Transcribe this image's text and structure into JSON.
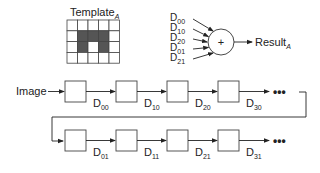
{
  "template": {
    "title": "Template",
    "subscript": "A",
    "rows": 4,
    "cols": 5,
    "filled": [
      [
        1,
        1
      ],
      [
        1,
        2
      ],
      [
        1,
        3
      ],
      [
        2,
        1
      ],
      [
        2,
        3
      ]
    ],
    "fill_color": "#555555"
  },
  "summation": {
    "inputs": [
      {
        "base": "D",
        "sub": "00"
      },
      {
        "base": "D",
        "sub": "10"
      },
      {
        "base": "D",
        "sub": "20"
      },
      {
        "base": "D",
        "sub": "01"
      },
      {
        "base": "D",
        "sub": "21"
      }
    ],
    "operator": "+",
    "output": {
      "base": "Result",
      "sub": "A"
    }
  },
  "pipeline": {
    "input_label": "Image",
    "row1": [
      {
        "base": "D",
        "sub": "00"
      },
      {
        "base": "D",
        "sub": "10"
      },
      {
        "base": "D",
        "sub": "20"
      },
      {
        "base": "D",
        "sub": "30"
      }
    ],
    "row2": [
      {
        "base": "D",
        "sub": "01"
      },
      {
        "base": "D",
        "sub": "11"
      },
      {
        "base": "D",
        "sub": "21"
      },
      {
        "base": "D",
        "sub": "31"
      }
    ],
    "continuation": "•••"
  }
}
